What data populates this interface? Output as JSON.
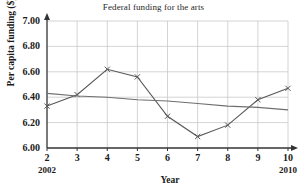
{
  "chart_data": {
    "type": "line",
    "title": "Federal funding for the arts",
    "xlabel": "Year",
    "ylabel": "Per capita funding ($)",
    "x": [
      2,
      3,
      4,
      5,
      6,
      7,
      8,
      9,
      10
    ],
    "xtick_labels": [
      "2",
      "3",
      "4",
      "5",
      "6",
      "7",
      "8",
      "9",
      "10"
    ],
    "xtick_sublabels": {
      "2": "2002",
      "10": "2010"
    },
    "ytick_labels": [
      "7.00",
      "6.80",
      "6.60",
      "6.40",
      "6.20",
      "6.00"
    ],
    "ytick_values": [
      7.0,
      6.8,
      6.6,
      6.4,
      6.2,
      6.0
    ],
    "xlim": [
      2,
      10
    ],
    "ylim": [
      6.0,
      7.0
    ],
    "grid": true,
    "legend": "none",
    "series": [
      {
        "name": "Per capita funding",
        "marker": "x",
        "color": "#585858",
        "values": [
          6.33,
          6.42,
          6.62,
          6.56,
          6.25,
          6.09,
          6.18,
          6.38,
          6.47
        ]
      },
      {
        "name": "Trend line",
        "marker": "none",
        "color": "#6e6e6e",
        "values": [
          6.43,
          6.41,
          6.4,
          6.38,
          6.37,
          6.35,
          6.33,
          6.32,
          6.3
        ]
      }
    ],
    "colors": {
      "axis": "#333333",
      "grid": "#c9c9c9",
      "data_line": "#585858",
      "trend_line": "#6e6e6e",
      "background": "#ffffff"
    }
  }
}
